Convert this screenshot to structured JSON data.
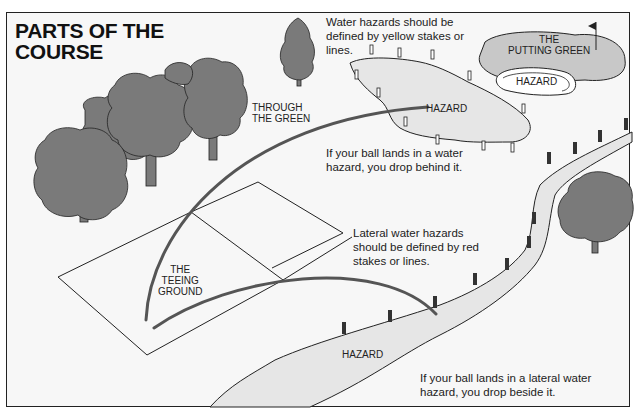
{
  "title": {
    "line1": "PARTS OF THE",
    "line2": "COURSE"
  },
  "labels": {
    "through_green": {
      "line1": "THROUGH",
      "line2": "THE GREEN"
    },
    "teeing_ground": {
      "line1": "THE",
      "line2": "TEEING",
      "line3": "GROUND"
    },
    "putting_green": {
      "line1": "THE",
      "line2": "PUTTING GREEN"
    },
    "bunker_hazard": "HAZARD",
    "water_hazard": "HAZARD",
    "lateral_hazard": "HAZARD"
  },
  "notes": {
    "water_def": {
      "line1": "Water hazards should be",
      "line2": "defined by yellow stakes or",
      "line3": "lines."
    },
    "water_rule": {
      "line1": "If your ball lands in a water",
      "line2": "hazard, you drop behind it."
    },
    "lateral_def": {
      "line1": "Lateral water hazards",
      "line2": "should be defined by red",
      "line3": "stakes or lines."
    },
    "lateral_rule": {
      "line1": "If your ball lands in a lateral water",
      "line2": "hazard, you drop beside it."
    }
  },
  "colors": {
    "background": "#f7f7f7",
    "tree": "#7a7a7a",
    "green": "#c8c8c8",
    "water": "#e6e6e6",
    "line": "#1a1a1a",
    "shot_path": "#555555"
  }
}
